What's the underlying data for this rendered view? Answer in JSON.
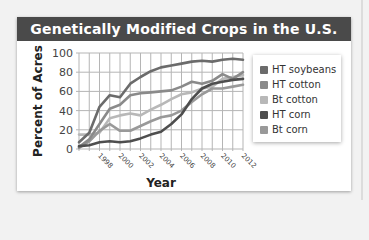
{
  "chart_data": {
    "type": "line",
    "title": "Genetically Modified Crops in the U.S.",
    "xlabel": "Year",
    "ylabel": "Percent of Acres",
    "x": [
      1996,
      1997,
      1998,
      1999,
      2000,
      2001,
      2002,
      2003,
      2004,
      2005,
      2006,
      2007,
      2008,
      2009,
      2010,
      2011,
      2012
    ],
    "xticks": [
      "1998",
      "2000",
      "2002",
      "2004",
      "2006",
      "2008",
      "2010",
      "2012"
    ],
    "yticks": [
      "0",
      "20",
      "40",
      "60",
      "80",
      "100"
    ],
    "ylim": [
      0,
      100
    ],
    "xlim": [
      1996,
      2012
    ],
    "grid": true,
    "legend_position": "right",
    "series": [
      {
        "name": "HT soybeans",
        "color": "#6b6b6b",
        "values": [
          7,
          17,
          44,
          56,
          54,
          68,
          75,
          81,
          85,
          87,
          89,
          91,
          92,
          91,
          93,
          94,
          93
        ]
      },
      {
        "name": "HT cotton",
        "color": "#8a8a8a",
        "values": [
          2,
          10,
          26,
          42,
          46,
          56,
          58,
          59,
          60,
          61,
          65,
          70,
          68,
          71,
          78,
          73,
          80
        ]
      },
      {
        "name": "Bt cotton",
        "color": "#b8b8b8",
        "values": [
          15,
          15,
          17,
          32,
          35,
          37,
          35,
          41,
          46,
          52,
          57,
          59,
          63,
          65,
          73,
          75,
          77
        ]
      },
      {
        "name": "HT corn",
        "color": "#4e4e4e",
        "values": [
          3,
          4,
          7,
          8,
          7,
          8,
          11,
          15,
          18,
          26,
          36,
          52,
          63,
          68,
          70,
          72,
          73
        ]
      },
      {
        "name": "Bt corn",
        "color": "#999999",
        "values": [
          1,
          8,
          19,
          26,
          19,
          19,
          24,
          29,
          33,
          35,
          40,
          49,
          57,
          63,
          63,
          65,
          67
        ]
      }
    ]
  },
  "legend": {
    "items": [
      {
        "label": "HT soybeans",
        "color": "#6b6b6b"
      },
      {
        "label": "HT cotton",
        "color": "#8a8a8a"
      },
      {
        "label": "Bt cotton",
        "color": "#b8b8b8"
      },
      {
        "label": "HT corn",
        "color": "#4e4e4e"
      },
      {
        "label": "Bt corn",
        "color": "#999999"
      }
    ]
  }
}
